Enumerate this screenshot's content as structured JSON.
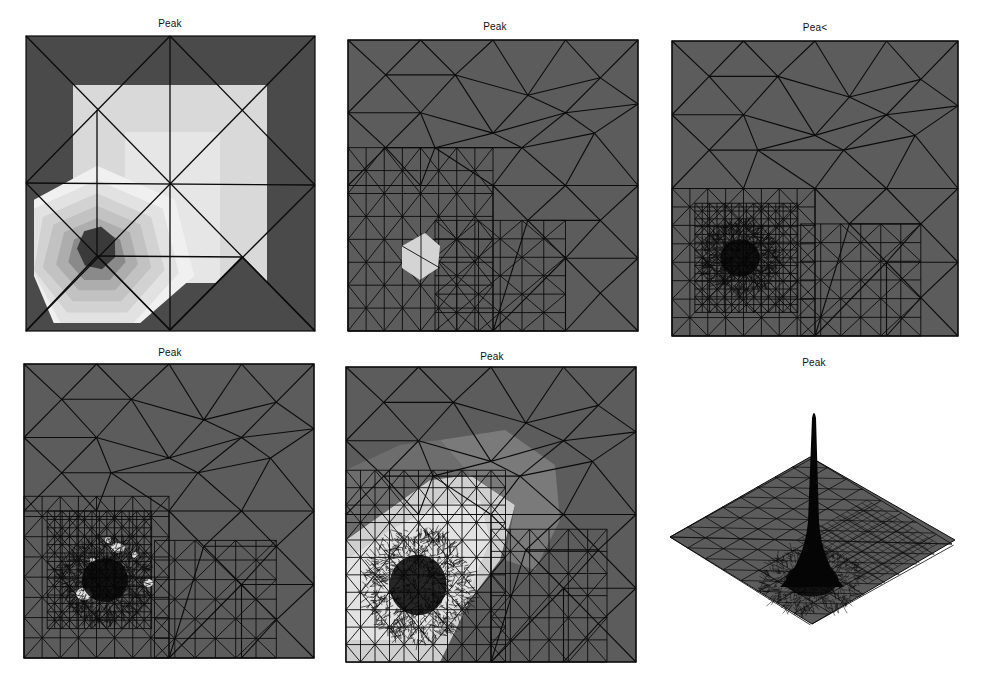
{
  "figure": {
    "background": "#ffffff",
    "colors": {
      "base_gray": "#5c5c5c",
      "line": "#0b0b0b",
      "light": "#d9d9d9",
      "lighter": "#e6e6e6",
      "mid": "#b4b4b4",
      "dark_core": "#3a3a3a",
      "dense": "#050505"
    },
    "panels": [
      {
        "id": "p1",
        "title": "Peak",
        "title_pos": [
          170,
          25
        ],
        "box": [
          26,
          36,
          315,
          331
        ],
        "kind": "initial-mesh-contour"
      },
      {
        "id": "p2",
        "title": "Peak",
        "title_pos": [
          495,
          28
        ],
        "box": [
          348,
          40,
          638,
          331
        ],
        "kind": "refined-mesh-1"
      },
      {
        "id": "p3",
        "title": "Pea<",
        "title_pos": [
          815,
          29
        ],
        "box": [
          672,
          41,
          958,
          336
        ],
        "kind": "refined-mesh-2"
      },
      {
        "id": "p4",
        "title": "Peak",
        "title_pos": [
          170,
          354
        ],
        "box": [
          24,
          364,
          314,
          658
        ],
        "kind": "refined-mesh-3"
      },
      {
        "id": "p5",
        "title": "Peak",
        "title_pos": [
          492,
          358
        ],
        "box": [
          346,
          367,
          636,
          662
        ],
        "kind": "refined-mesh-4"
      },
      {
        "id": "p6",
        "title": "Peak",
        "title_pos": [
          814,
          364
        ],
        "kind": "surface-3d",
        "diamond": [
          [
            670,
            537
          ],
          [
            810,
            457
          ],
          [
            955,
            540
          ],
          [
            812,
            624
          ]
        ],
        "spike_tip": [
          814,
          412
        ],
        "spike_base_center": [
          812,
          575
        ]
      }
    ]
  },
  "chart_data": {
    "type": "mesh",
    "title": "Peak",
    "panels": [
      {
        "title": "Peak",
        "description": "coarse initial triangulation with piecewise-constant contour bands; dark core near lower-left center"
      },
      {
        "title": "Peak",
        "description": "first adaptive refinement; small bright hexagonal region lower-left"
      },
      {
        "title": "Pea<",
        "description": "second refinement; dense cluster of triangles around the peak at lower-left"
      },
      {
        "title": "Peak",
        "description": "third refinement; dense cluster with bright speckles"
      },
      {
        "title": "Peak",
        "description": "solution shading on refined mesh; large light band around the dense peak region"
      },
      {
        "title": "Peak",
        "description": "3D surface view of solution showing a single sharp spike"
      }
    ]
  }
}
